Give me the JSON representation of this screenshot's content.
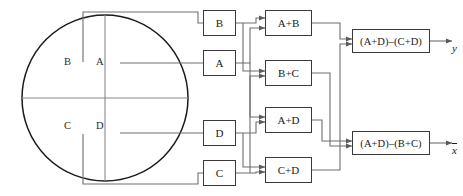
{
  "diagram": {
    "colors": {
      "box_border": "#3a3a3a",
      "wire": "#6e6e6e",
      "circle_stroke": "#1a1a1a",
      "text": "#1a1a1a",
      "background": "#ffffff"
    },
    "detector": {
      "name": "quadrant-detector",
      "shape": "circle",
      "quadrants": [
        {
          "id": "B",
          "label": "B",
          "position": "top-left"
        },
        {
          "id": "A",
          "label": "A",
          "position": "top-right"
        },
        {
          "id": "C",
          "label": "C",
          "position": "bottom-left"
        },
        {
          "id": "D",
          "label": "D",
          "position": "bottom-right"
        }
      ]
    },
    "input_boxes": [
      {
        "id": "B",
        "label": "B"
      },
      {
        "id": "A",
        "label": "A"
      },
      {
        "id": "D",
        "label": "D"
      },
      {
        "id": "C",
        "label": "C"
      }
    ],
    "sum_boxes": [
      {
        "id": "AB",
        "label": "A+B"
      },
      {
        "id": "BC",
        "label": "B+C"
      },
      {
        "id": "AD",
        "label": "A+D"
      },
      {
        "id": "CD",
        "label": "C+D"
      }
    ],
    "output_boxes": [
      {
        "id": "y",
        "label": "(A+D)–(C+D)"
      },
      {
        "id": "x",
        "label": "(A+D)–(B+C)"
      }
    ],
    "outputs": [
      {
        "id": "y",
        "label": "y",
        "overbar": false
      },
      {
        "id": "x",
        "label": "x",
        "overbar": true
      }
    ]
  }
}
